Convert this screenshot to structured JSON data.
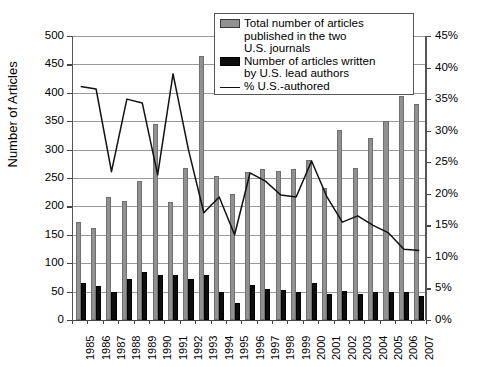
{
  "chart_data": {
    "type": "bar",
    "title": "",
    "xlabel": "",
    "ylabel": "Number of Articles",
    "y2label": "",
    "ylim": [
      0,
      500
    ],
    "y2lim": [
      0,
      45
    ],
    "yticks": [
      "0",
      "50",
      "100",
      "150",
      "200",
      "250",
      "300",
      "350",
      "400",
      "450",
      "500"
    ],
    "y2ticks": [
      "0%",
      "5%",
      "10%",
      "15%",
      "20%",
      "25%",
      "30%",
      "35%",
      "40%",
      "45%"
    ],
    "grid": true,
    "legend_position": "top-right",
    "categories": [
      "1985",
      "1986",
      "1987",
      "1988",
      "1989",
      "1990",
      "1991",
      "1992",
      "1993",
      "1994",
      "1995",
      "1996",
      "1997",
      "1998",
      "1999",
      "2000",
      "2001",
      "2002",
      "2003",
      "2004",
      "2005",
      "2006",
      "2007"
    ],
    "series": [
      {
        "name": "Total number of articles published in the two U.S. journals",
        "type": "bar",
        "color": "#919191",
        "axis": "left",
        "values": [
          173,
          162,
          217,
          210,
          245,
          345,
          207,
          268,
          465,
          253,
          222,
          260,
          265,
          263,
          265,
          281,
          233,
          335,
          268,
          320,
          350,
          394,
          380
        ]
      },
      {
        "name": "Number of articles written by U.S. lead authors",
        "type": "bar",
        "color": "#0d0d0d",
        "axis": "left",
        "values": [
          65,
          60,
          50,
          72,
          85,
          80,
          80,
          73,
          80,
          50,
          30,
          62,
          54,
          52,
          50,
          65,
          46,
          51,
          45,
          50,
          50,
          49,
          42
        ]
      },
      {
        "name": "% U.S.-authored",
        "type": "line",
        "color": "#111111",
        "axis": "right",
        "values": [
          37.0,
          36.6,
          23.5,
          35.0,
          34.4,
          23.0,
          39.0,
          27.0,
          17.0,
          19.5,
          13.5,
          23.3,
          22.0,
          19.8,
          19.5,
          25.2,
          19.5,
          15.5,
          16.5,
          15.0,
          13.8,
          11.2,
          11.0
        ]
      }
    ]
  },
  "legend": {
    "entries": [
      {
        "swatch": "total",
        "line1": "Total number of articles",
        "line2": "published in the two",
        "line3": "U.S. journals"
      },
      {
        "swatch": "us",
        "line1": "Number of articles written",
        "line2": "by U.S. lead authors"
      },
      {
        "swatch": "line",
        "line1": "% U.S.-authored"
      }
    ]
  }
}
